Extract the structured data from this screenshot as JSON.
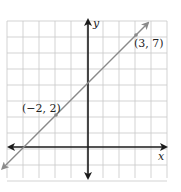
{
  "chart_data": {
    "type": "line",
    "title": "",
    "xlabel": "x",
    "ylabel": "y",
    "xlim": [
      -5,
      5
    ],
    "ylim": [
      -2,
      8
    ],
    "grid": true,
    "grid_step": 1,
    "series": [
      {
        "name": "y = x + 4",
        "x": [
          -2,
          3
        ],
        "y": [
          2,
          7
        ],
        "style": "line with arrows at both ends",
        "color": "#8a8a8a"
      }
    ],
    "annotations": [
      {
        "text": "(−2, 2)",
        "x": -2,
        "y": 2
      },
      {
        "text": "(3, 7)",
        "x": 3,
        "y": 7
      }
    ]
  },
  "labels": {
    "x_axis": "x",
    "y_axis": "y",
    "point_a": "(−2, 2)",
    "point_b": "(3, 7)"
  },
  "colors": {
    "grid": "#c8c8c8",
    "axes": "#1a1a1a",
    "line": "#8a8a8a"
  }
}
